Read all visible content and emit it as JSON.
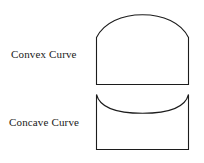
{
  "figure": {
    "background_color": "#ffffff",
    "stroke_color": "#1c1c1c",
    "labels": [
      {
        "id": "convex",
        "text": "Convex Curve"
      },
      {
        "id": "concave",
        "text": "Concave Curve"
      }
    ],
    "shapes": [
      {
        "id": "convex-curve-shape",
        "name": "convex-curve",
        "description": "rectangle with outward bulging arched top",
        "left": 96,
        "right": 189,
        "bottom": 85,
        "side_top": 37,
        "arc_apex": 15
      },
      {
        "id": "concave-curve-shape",
        "name": "concave-curve",
        "description": "rectangle with inward dipping curved top",
        "left": 96,
        "right": 189,
        "top_corners": 94,
        "curve_lowest": 113,
        "bottom": 149
      }
    ]
  }
}
